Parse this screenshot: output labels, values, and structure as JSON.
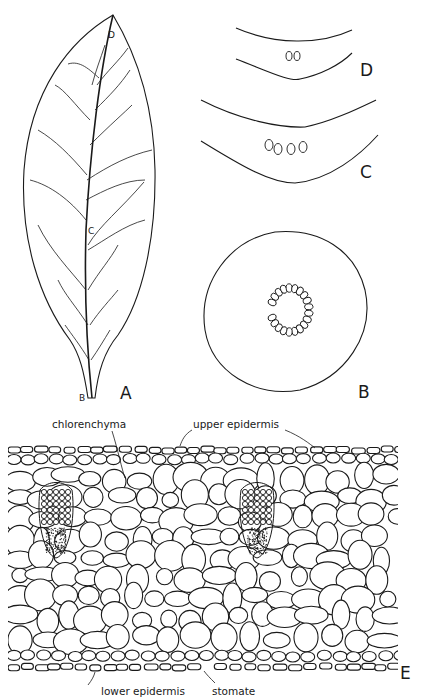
{
  "figure": {
    "panels": [
      {
        "id": "A",
        "label": "A",
        "description": "whole leaf with venation; positions B, C, D marked along midrib"
      },
      {
        "id": "B",
        "label": "B",
        "description": "petiole cross-section with ring of vascular bundles"
      },
      {
        "id": "C",
        "label": "C",
        "description": "midrib cross-section at mid-blade with 4 bundles"
      },
      {
        "id": "D",
        "label": "D",
        "description": "midrib cross-section near apex with 2 bundles"
      },
      {
        "id": "E",
        "label": "E",
        "description": "transverse section of leaf blade tissue"
      }
    ],
    "leaf_markers": {
      "b": "B",
      "c": "C",
      "d": "D"
    },
    "annotations": {
      "chlorenchyma": "chlorenchyma",
      "upper_epidermis": "upper epidermis",
      "lower_epidermis": "lower epidermis",
      "stomate": "stomate"
    },
    "bundle_counts": {
      "D": 2,
      "C": 4,
      "B": 20
    },
    "colors": {
      "ink": "#1a1a1a",
      "background": "#ffffff"
    }
  }
}
